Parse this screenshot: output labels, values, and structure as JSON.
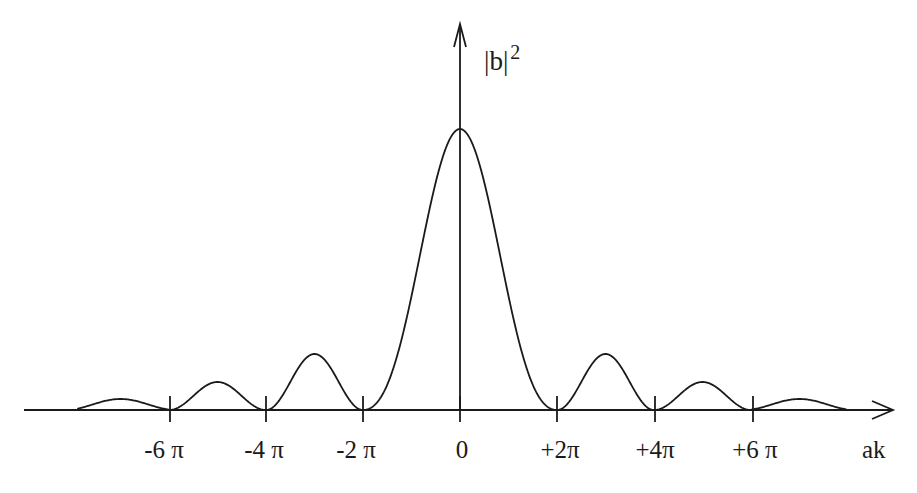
{
  "diagram": {
    "y_axis_label": "|b|",
    "y_axis_exponent": "2",
    "x_axis_label": "ak",
    "ticks": [
      {
        "label": "-6 π",
        "x": 170
      },
      {
        "label": "-4 π",
        "x": 266
      },
      {
        "label": "-2 π",
        "x": 363
      },
      {
        "label": "0",
        "x": 460
      },
      {
        "label": "+2π",
        "x": 557
      },
      {
        "label": "+4π",
        "x": 655
      },
      {
        "label": "+6 π",
        "x": 753
      }
    ],
    "curve": "sinc-squared diffraction pattern: central maximum at ak = 0, zeros at ak = ±2π, ±4π, ±6π, decaying side lobes at ±3π, ±5π, ±7π",
    "line_color": "#1a1a1a",
    "background_color": "#ffffff"
  }
}
